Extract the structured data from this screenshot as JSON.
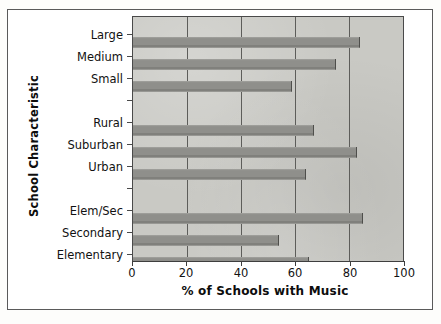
{
  "chart_data": {
    "type": "bar",
    "orientation": "horizontal",
    "title": "",
    "xlabel": "% of Schools with Music",
    "ylabel": "School Characteristic",
    "xlim": [
      0,
      100
    ],
    "xticks": [
      0,
      20,
      40,
      60,
      80,
      100
    ],
    "xtick_labels": [
      "0",
      "20",
      "40",
      "60",
      "80",
      "100"
    ],
    "grid": "vertical",
    "legend": "none",
    "categories": [
      "Large",
      "Medium",
      "Small",
      "",
      "Rural",
      "Suburban",
      "Urban",
      "",
      "Elem/Sec",
      "Secondary",
      "Elementary"
    ],
    "values": [
      84,
      75,
      59,
      null,
      67,
      83,
      64,
      null,
      85,
      54,
      65
    ],
    "groups": [
      {
        "name": "School Size",
        "categories": [
          "Large",
          "Medium",
          "Small"
        ],
        "values": [
          84,
          75,
          59
        ]
      },
      {
        "name": "Community Type",
        "categories": [
          "Rural",
          "Suburban",
          "Urban"
        ],
        "values": [
          67,
          83,
          64
        ]
      },
      {
        "name": "School Level",
        "categories": [
          "Elem/Sec",
          "Secondary",
          "Elementary"
        ],
        "values": [
          85,
          54,
          65
        ]
      }
    ],
    "bar_color": "#8f8f8b",
    "plot_background": "#c9c9c4",
    "axis_color": "#4a4a4a"
  }
}
